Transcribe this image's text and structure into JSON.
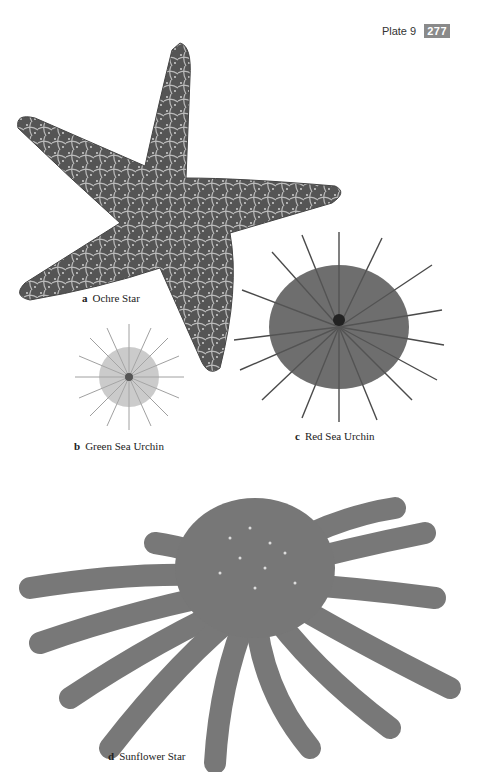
{
  "header": {
    "plate_label": "Plate 9",
    "page_number": "277"
  },
  "figures": [
    {
      "letter": "a",
      "name": "Ochre Star"
    },
    {
      "letter": "b",
      "name": "Green Sea Urchin"
    },
    {
      "letter": "c",
      "name": "Red Sea Urchin"
    },
    {
      "letter": "d",
      "name": "Sunflower Star"
    }
  ],
  "colors": {
    "badge": "#8a8a8a",
    "illustration_dark": "#4a4a4a",
    "illustration_light": "#9a9a9a"
  }
}
